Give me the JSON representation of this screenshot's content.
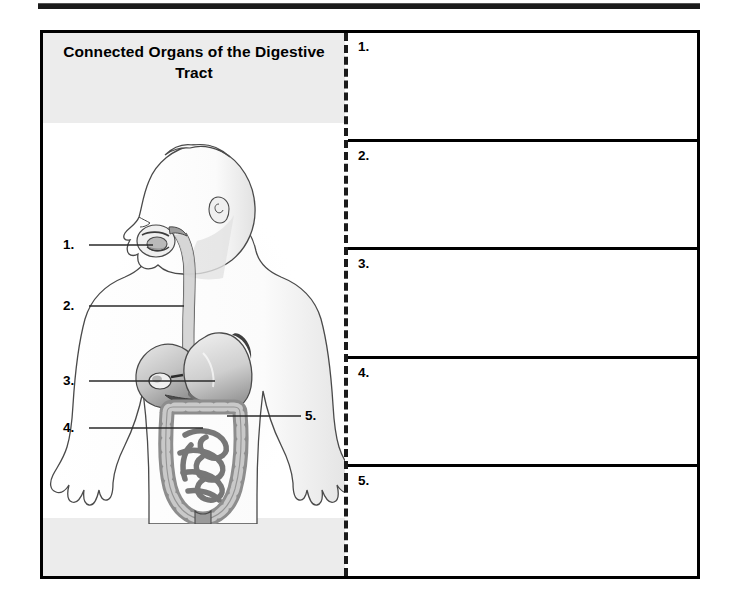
{
  "page": {
    "top_rule": "horizontal-rule"
  },
  "worksheet": {
    "title": "Connected Organs of the Digestive Tract",
    "diagram": {
      "name": "digestive-tract-figure",
      "description": "Side-view human figure showing connected digestive organs",
      "callouts": [
        {
          "number": "1.",
          "target": "mouth"
        },
        {
          "number": "2.",
          "target": "esophagus"
        },
        {
          "number": "3.",
          "target": "stomach"
        },
        {
          "number": "4.",
          "target": "small-intestine"
        },
        {
          "number": "5.",
          "target": "large-intestine"
        }
      ]
    },
    "answers": [
      {
        "number": "1.",
        "value": ""
      },
      {
        "number": "2.",
        "value": ""
      },
      {
        "number": "3.",
        "value": ""
      },
      {
        "number": "4.",
        "value": ""
      },
      {
        "number": "5.",
        "value": ""
      }
    ]
  },
  "colors": {
    "ink": "#000000",
    "band": "#ececec",
    "organ_light": "#d8d8d8",
    "organ_mid": "#a8a8a8",
    "organ_dark": "#6e6e6e"
  }
}
